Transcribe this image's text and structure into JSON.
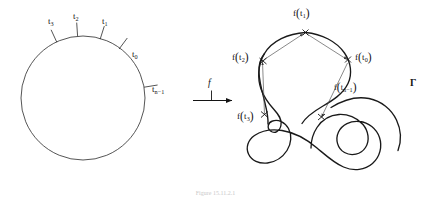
{
  "figure": {
    "caption": "Figure 15.11.2.1",
    "map_arrow_label": "f",
    "domain": {
      "shape_name": "circle",
      "center": [
        83,
        98
      ],
      "radius": 62,
      "tick_labels": [
        {
          "name": "t0",
          "text_main": "t",
          "sub": "0"
        },
        {
          "name": "t1",
          "text_main": "t",
          "sub": "1"
        },
        {
          "name": "t2",
          "text_main": "t",
          "sub": "2"
        },
        {
          "name": "t3",
          "text_main": "t",
          "sub": "3"
        },
        {
          "name": "tn1",
          "text_main": "t",
          "sub": "n−1"
        }
      ]
    },
    "codomain": {
      "curve_label": "Γ",
      "point_labels": [
        {
          "name": "f-t0",
          "fn": "f",
          "open": "(",
          "arg_main": "t",
          "sub": "0",
          "close": ")"
        },
        {
          "name": "f-t1",
          "fn": "f",
          "open": "(",
          "arg_main": "t",
          "sub": "1",
          "close": ")"
        },
        {
          "name": "f-t2",
          "fn": "f",
          "open": "(",
          "arg_main": "t",
          "sub": "2",
          "close": ")"
        },
        {
          "name": "f-t3",
          "fn": "f",
          "open": "(",
          "arg_main": "t",
          "sub": "3",
          "close": ")"
        },
        {
          "name": "f-tn1",
          "fn": "f",
          "open": "(",
          "arg_main": "t",
          "sub": "n−1",
          "close": ")"
        }
      ]
    },
    "colors": {
      "ink": "#141414",
      "curve": "#1a1a1a",
      "chord": "#555555",
      "background": "#ffffff"
    }
  }
}
